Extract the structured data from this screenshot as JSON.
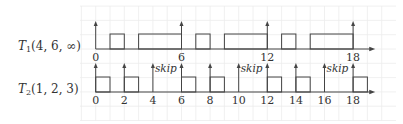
{
  "diagram": {
    "type": "schedule-timeline",
    "unit_px": 14.3,
    "origin_x": 95.7,
    "colors": {
      "line": "#444444",
      "grid": "#ececec",
      "text": "#333333"
    },
    "tasks": [
      {
        "name_main": "T",
        "name_sub": "1",
        "params": "(4, 6, ∞)",
        "axis_y": 49,
        "box_top": 34,
        "arrow_top": 22,
        "release_arrows": [
          0,
          6,
          12,
          18
        ],
        "tick_labels": [
          "0",
          "6",
          "12",
          "18"
        ],
        "tick_label_positions": [
          0,
          6,
          12,
          18
        ],
        "executions": [
          [
            1,
            2
          ],
          [
            3,
            6
          ],
          [
            7,
            8
          ],
          [
            9,
            12
          ],
          [
            13,
            14
          ],
          [
            15,
            18
          ]
        ],
        "skips": []
      },
      {
        "name_main": "T",
        "name_sub": "2",
        "params": "(1, 2, 3)",
        "axis_y": 92,
        "box_top": 77,
        "arrow_top": 64,
        "release_arrows": [
          0,
          2,
          4,
          6,
          8,
          10,
          12,
          14,
          16,
          18
        ],
        "tick_labels": [
          "0",
          "2",
          "4",
          "6",
          "8",
          "10",
          "12",
          "14",
          "16",
          "18"
        ],
        "tick_label_positions": [
          0,
          2,
          4,
          6,
          8,
          10,
          12,
          14,
          16,
          18
        ],
        "executions": [
          [
            0,
            1
          ],
          [
            2,
            3
          ],
          [
            6,
            7
          ],
          [
            8,
            9
          ],
          [
            12,
            13
          ],
          [
            14,
            15
          ],
          [
            18,
            19
          ]
        ],
        "skips": [
          4,
          10,
          16
        ],
        "skip_label": "skip"
      }
    ]
  }
}
